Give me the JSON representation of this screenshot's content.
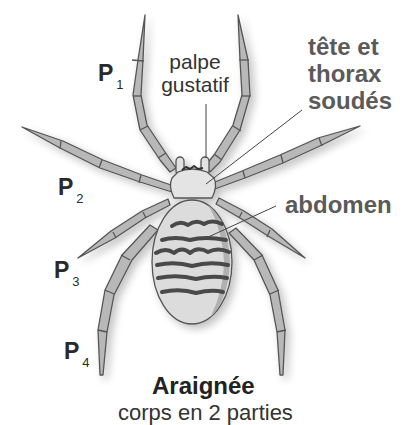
{
  "figure": {
    "title": "Araignée",
    "subtitle": "corps en 2 parties",
    "top_clipped_text": "",
    "colors": {
      "background": "#ffffff",
      "leg_fill": "#b4b4b4",
      "leg_stroke": "#555555",
      "body_fill": "#dedede",
      "stripe": "#4a4a4a",
      "label_dark": "#2a2a2a",
      "label_grey": "#5a5a5a",
      "leader_line": "#444444"
    }
  },
  "labels": {
    "legs": [
      {
        "letter": "P",
        "index": "1"
      },
      {
        "letter": "P",
        "index": "2"
      },
      {
        "letter": "P",
        "index": "3"
      },
      {
        "letter": "P",
        "index": "4"
      }
    ],
    "palpe": {
      "line1": "palpe",
      "line2": "gustatif"
    },
    "cephalothorax": {
      "line1": "tête et",
      "line2": "thorax",
      "line3": "soudés"
    },
    "abdomen": "abdomen"
  }
}
